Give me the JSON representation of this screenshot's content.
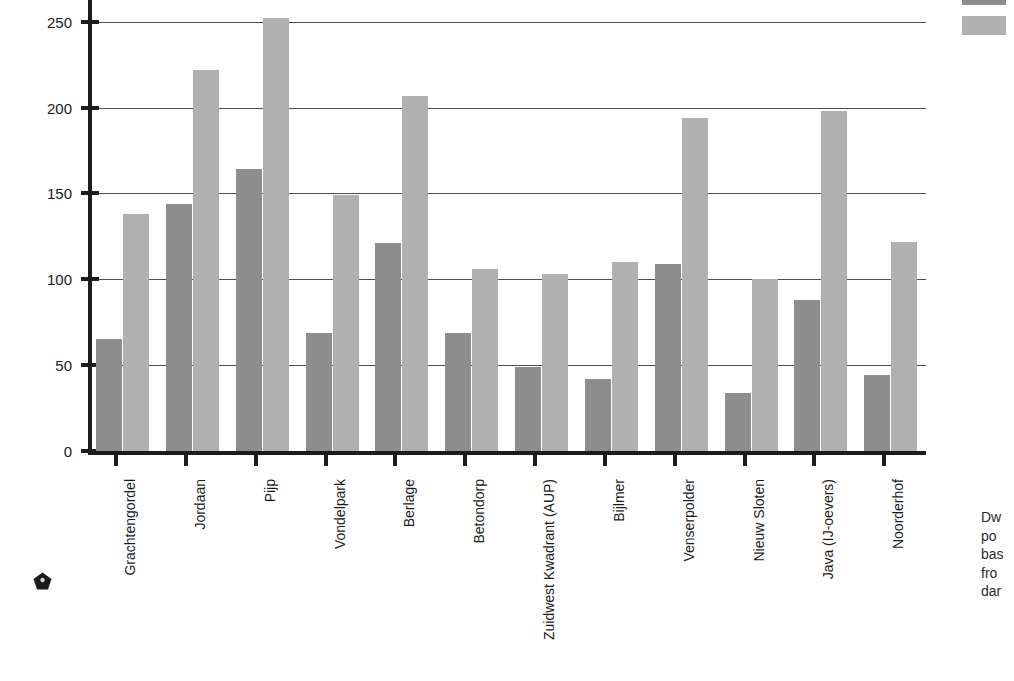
{
  "chart_data": {
    "type": "bar",
    "title": "",
    "xlabel": "",
    "ylabel": "density",
    "ylim": [
      0,
      265
    ],
    "yticks": [
      0,
      50,
      100,
      150,
      200,
      250
    ],
    "grid": "horizontal",
    "legend_position": "top-right",
    "categories": [
      "Grachtengordel",
      "Jordaan",
      "Pijp",
      "Vondelpark",
      "Berlage",
      "Betondorp",
      "Zuidwest Kwadrant (AUP)",
      "Bijlmer",
      "Venserpolder",
      "Nieuw Sloten",
      "Java (IJ-oevers)",
      "Noorderhof"
    ],
    "series": [
      {
        "name": "",
        "color": "#8d8d8d",
        "values": [
          65,
          144,
          164,
          69,
          121,
          69,
          49,
          42,
          109,
          34,
          88,
          44
        ]
      },
      {
        "name": "",
        "color": "#b0b0b0",
        "values": [
          138,
          222,
          252,
          149,
          207,
          106,
          103,
          110,
          194,
          100,
          198,
          122
        ]
      }
    ]
  },
  "legend": {
    "items": [
      {
        "label": "",
        "color": "#8d8d8d"
      },
      {
        "label": "",
        "color": "#b0b0b0"
      }
    ]
  },
  "caption": {
    "lines": [
      "Dw",
      "po",
      "bas",
      "fro",
      "dar"
    ]
  },
  "page_mark": {
    "shape": "pentagon",
    "color": "#1c1c1c"
  },
  "colors": {
    "series_dark": "#8d8d8d",
    "series_light": "#b0b0b0",
    "axis": "#1c1c1c",
    "grid": "#4d4d4d",
    "text": "#1a1a1a",
    "background": "#ffffff"
  }
}
